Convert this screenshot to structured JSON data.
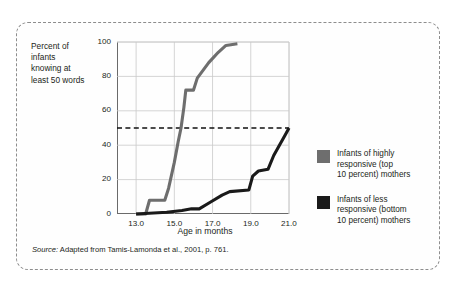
{
  "figure": {
    "source_prefix": "Source:",
    "source_text": " Adapted from Tamis-Lamonda et al., 2001, p. 761."
  },
  "legend": {
    "entries": [
      {
        "label": "Infants of highly\nresponsive (top\n10 percent) mothers",
        "color": "#6e6e6e"
      },
      {
        "label": "Infants of less\nresponsive (bottom\n10 percent) mothers",
        "color": "#1a1a1a"
      }
    ]
  },
  "chart_data": {
    "type": "line",
    "title": "",
    "xlabel": "Age in months",
    "ylabel": "Percent of\ninfants\nknowing at\nleast 50 words",
    "xlim": [
      12.0,
      21.0
    ],
    "ylim": [
      0,
      100
    ],
    "xticks": [
      "13.0",
      "15.0",
      "17.0",
      "19.0",
      "21.0"
    ],
    "xtick_values": [
      13.0,
      15.0,
      17.0,
      19.0,
      21.0
    ],
    "yticks": [
      "0",
      "20",
      "40",
      "60",
      "80",
      "100"
    ],
    "ytick_values": [
      0,
      20,
      40,
      60,
      80,
      100
    ],
    "grid": true,
    "legend_position": "right",
    "annotations": [
      {
        "type": "hline",
        "value": 50,
        "style": "dashed",
        "color": "#111111",
        "label": "50 percent reference line"
      }
    ],
    "series": [
      {
        "name": "Infants of highly responsive (top 10 percent) mothers",
        "color": "#6e6e6e",
        "points": [
          [
            13.0,
            0
          ],
          [
            13.5,
            0
          ],
          [
            13.7,
            8
          ],
          [
            14.5,
            8
          ],
          [
            14.7,
            15
          ],
          [
            15.0,
            30
          ],
          [
            15.2,
            42
          ],
          [
            15.35,
            50
          ],
          [
            15.5,
            62
          ],
          [
            15.6,
            72
          ],
          [
            16.0,
            72
          ],
          [
            16.2,
            79
          ],
          [
            16.8,
            88
          ],
          [
            17.3,
            94
          ],
          [
            17.7,
            98
          ],
          [
            18.3,
            99
          ]
        ]
      },
      {
        "name": "Infants of less responsive (bottom 10 percent) mothers",
        "color": "#1a1a1a",
        "points": [
          [
            13.0,
            0
          ],
          [
            14.6,
            1
          ],
          [
            15.4,
            2
          ],
          [
            15.9,
            3
          ],
          [
            16.3,
            3
          ],
          [
            16.9,
            7
          ],
          [
            17.5,
            11
          ],
          [
            17.9,
            13
          ],
          [
            18.9,
            14
          ],
          [
            19.1,
            22
          ],
          [
            19.4,
            25
          ],
          [
            19.9,
            26
          ],
          [
            20.2,
            34
          ],
          [
            20.5,
            40
          ],
          [
            20.8,
            46
          ],
          [
            21.0,
            50
          ]
        ]
      }
    ]
  }
}
